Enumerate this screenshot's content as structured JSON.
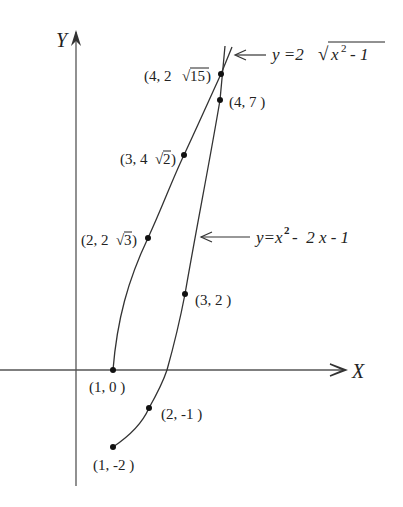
{
  "diagram": {
    "axes": {
      "x_label": "X",
      "y_label": "Y"
    },
    "curves": [
      {
        "name": "upper",
        "equation_prefix": "y =2",
        "equation_radicand": "x",
        "radicand_exp": "2",
        "radicand_tail": " - 1"
      },
      {
        "name": "lower",
        "equation_prefix": "y=x",
        "equation_exp": "2",
        "equation_tail": "-  2 x - 1"
      }
    ],
    "points": [
      {
        "label": "(4, 2",
        "root": "15",
        "close": " )"
      },
      {
        "label": "(4, 7 )"
      },
      {
        "label": "(3, 4",
        "root": "2",
        "close": ")"
      },
      {
        "label": "(2, 2",
        "root": "3",
        "close": " )"
      },
      {
        "label": "(3, 2 )"
      },
      {
        "label": "(1, 0 )"
      },
      {
        "label": "(2, -1 )"
      },
      {
        "label": "(1, -2 )"
      }
    ]
  }
}
